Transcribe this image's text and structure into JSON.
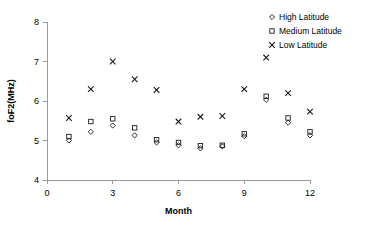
{
  "chart_data": {
    "type": "scatter",
    "title": "",
    "xlabel": "Month",
    "ylabel": "foF2(MHz)",
    "xlim": [
      0,
      12
    ],
    "ylim": [
      4,
      8
    ],
    "xticks": [
      0,
      3,
      6,
      9,
      12
    ],
    "yticks": [
      4,
      5,
      6,
      7,
      8
    ],
    "grid": false,
    "legend_position": "top-right",
    "x": [
      1,
      2,
      3,
      4,
      5,
      6,
      7,
      8,
      9,
      10,
      11,
      12
    ],
    "series": [
      {
        "name": "High Latitude",
        "marker": "diamond",
        "values": [
          5.0,
          5.22,
          5.38,
          5.13,
          4.95,
          4.88,
          4.8,
          4.85,
          5.11,
          6.03,
          5.45,
          5.13
        ]
      },
      {
        "name": "Medium Latitude",
        "marker": "square",
        "values": [
          5.1,
          5.48,
          5.55,
          5.32,
          5.02,
          4.95,
          4.87,
          4.88,
          5.17,
          6.12,
          5.57,
          5.22
        ]
      },
      {
        "name": "Low Latitude",
        "marker": "cross",
        "values": [
          5.57,
          6.3,
          7.0,
          6.55,
          6.28,
          5.48,
          5.6,
          5.62,
          6.3,
          7.1,
          6.2,
          5.73
        ]
      }
    ]
  },
  "legend": {
    "entries": [
      {
        "label": "High Latitude",
        "marker": "diamond"
      },
      {
        "label": "Medium Latitude",
        "marker": "square"
      },
      {
        "label": "Low Latitude",
        "marker": "cross"
      }
    ]
  },
  "colors": {
    "marker": "#1a1a1a",
    "axis": "#9a9a9a",
    "background": "#ffffff"
  }
}
